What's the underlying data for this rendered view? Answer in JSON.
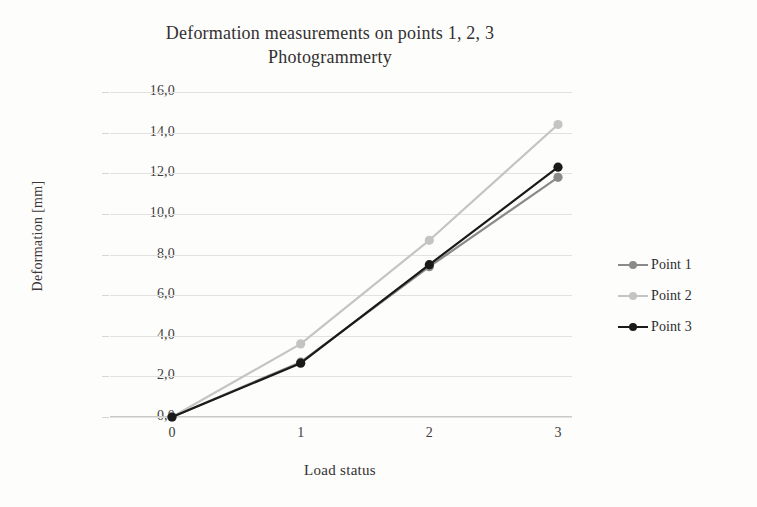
{
  "chart_data": {
    "type": "line",
    "title": "Deformation measurements on points 1, 2, 3 Photogrammerty",
    "title_lines": [
      "Deformation measurements on points 1, 2, 3",
      "Photogrammerty"
    ],
    "xlabel": "Load status",
    "ylabel": "Deformation [mm]",
    "categories": [
      "0",
      "1",
      "2",
      "3"
    ],
    "x": [
      0,
      1,
      2,
      3
    ],
    "ylim": [
      0,
      16
    ],
    "ytick_step": 2,
    "ytick_labels": [
      "0,0",
      "2,0",
      "4,0",
      "6,0",
      "8,0",
      "10,0",
      "12,0",
      "14,0",
      "16,0"
    ],
    "ytick_values": [
      0,
      2,
      4,
      6,
      8,
      10,
      12,
      14,
      16
    ],
    "grid": "horizontal",
    "legend_position": "right",
    "decimal_separator": ",",
    "series": [
      {
        "name": "Point 1",
        "color": "#8a8a8a",
        "marker": "circle",
        "values": [
          0.0,
          2.7,
          7.4,
          11.8
        ]
      },
      {
        "name": "Point 2",
        "color": "#c4c4c4",
        "marker": "circle",
        "values": [
          0.0,
          3.6,
          8.7,
          14.4
        ]
      },
      {
        "name": "Point 3",
        "color": "#1a1a1a",
        "marker": "circle",
        "values": [
          0.0,
          2.65,
          7.5,
          12.3
        ]
      }
    ]
  }
}
